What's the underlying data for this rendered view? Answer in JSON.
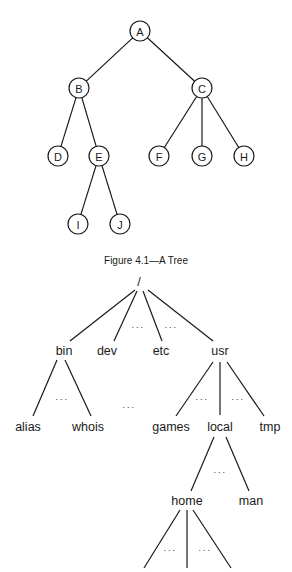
{
  "figure1": {
    "caption": "Figure 4.1—A Tree",
    "radius": 10,
    "nodes": [
      {
        "id": "A",
        "label": "A",
        "x": 140,
        "y": 31
      },
      {
        "id": "B",
        "label": "B",
        "x": 79,
        "y": 88
      },
      {
        "id": "C",
        "label": "C",
        "x": 202,
        "y": 88
      },
      {
        "id": "D",
        "label": "D",
        "x": 58,
        "y": 156
      },
      {
        "id": "E",
        "label": "E",
        "x": 99,
        "y": 156
      },
      {
        "id": "F",
        "label": "F",
        "x": 159,
        "y": 156
      },
      {
        "id": "G",
        "label": "G",
        "x": 202,
        "y": 156
      },
      {
        "id": "H",
        "label": "H",
        "x": 244,
        "y": 156
      },
      {
        "id": "I",
        "label": "I",
        "x": 78,
        "y": 224
      },
      {
        "id": "J",
        "label": "J",
        "x": 120,
        "y": 224
      }
    ],
    "edges": [
      [
        "A",
        "B"
      ],
      [
        "A",
        "C"
      ],
      [
        "B",
        "D"
      ],
      [
        "B",
        "E"
      ],
      [
        "C",
        "F"
      ],
      [
        "C",
        "G"
      ],
      [
        "C",
        "H"
      ],
      [
        "E",
        "I"
      ],
      [
        "E",
        "J"
      ]
    ]
  },
  "figure2": {
    "nodes": [
      {
        "id": "root",
        "label": "/",
        "x": 139,
        "y": 282
      },
      {
        "id": "bin",
        "label": "bin",
        "x": 64,
        "y": 351
      },
      {
        "id": "dev",
        "label": "dev",
        "x": 107,
        "y": 351
      },
      {
        "id": "etc",
        "label": "etc",
        "x": 161,
        "y": 351
      },
      {
        "id": "usr",
        "label": "usr",
        "x": 220,
        "y": 351
      },
      {
        "id": "alias",
        "label": "alias",
        "x": 28,
        "y": 427
      },
      {
        "id": "whois",
        "label": "whois",
        "x": 88,
        "y": 427
      },
      {
        "id": "games",
        "label": "games",
        "x": 171,
        "y": 427
      },
      {
        "id": "local",
        "label": "local",
        "x": 220,
        "y": 427
      },
      {
        "id": "tmp",
        "label": "tmp",
        "x": 270,
        "y": 427
      },
      {
        "id": "home",
        "label": "home",
        "x": 187,
        "y": 501
      },
      {
        "id": "man",
        "label": "man",
        "x": 251,
        "y": 501
      }
    ],
    "edges": [
      {
        "x1": 135,
        "y1": 290,
        "x2": 70,
        "y2": 341
      },
      {
        "x1": 137,
        "y1": 291,
        "x2": 114,
        "y2": 341
      },
      {
        "x1": 143,
        "y1": 291,
        "x2": 162,
        "y2": 341
      },
      {
        "x1": 148,
        "y1": 290,
        "x2": 213,
        "y2": 341
      },
      {
        "x1": 57,
        "y1": 360,
        "x2": 33,
        "y2": 416
      },
      {
        "x1": 65,
        "y1": 360,
        "x2": 91,
        "y2": 416
      },
      {
        "x1": 213,
        "y1": 362,
        "x2": 176,
        "y2": 416
      },
      {
        "x1": 220,
        "y1": 362,
        "x2": 220,
        "y2": 415
      },
      {
        "x1": 227,
        "y1": 362,
        "x2": 264,
        "y2": 416
      },
      {
        "x1": 214,
        "y1": 437,
        "x2": 191,
        "y2": 491
      },
      {
        "x1": 226,
        "y1": 437,
        "x2": 249,
        "y2": 491
      },
      {
        "x1": 180,
        "y1": 510,
        "x2": 144,
        "y2": 568
      },
      {
        "x1": 187,
        "y1": 510,
        "x2": 187,
        "y2": 568
      },
      {
        "x1": 193,
        "y1": 510,
        "x2": 231,
        "y2": 568
      }
    ],
    "ellipses": [
      {
        "text": "...",
        "x": 138,
        "y": 330
      },
      {
        "text": "...",
        "x": 171,
        "y": 330
      },
      {
        "text": "...",
        "x": 62,
        "y": 402
      },
      {
        "text": "...",
        "x": 129,
        "y": 410
      },
      {
        "text": "...",
        "x": 202,
        "y": 402
      },
      {
        "text": "...",
        "x": 238,
        "y": 402
      },
      {
        "text": "...",
        "x": 220,
        "y": 475
      },
      {
        "text": "...",
        "x": 170,
        "y": 553
      },
      {
        "text": "...",
        "x": 205,
        "y": 553
      }
    ]
  }
}
